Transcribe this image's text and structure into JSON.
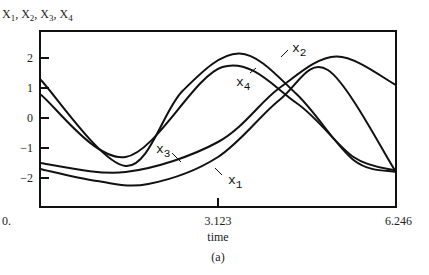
{
  "chart_data": {
    "type": "line",
    "title": "",
    "ylabel": "X1, X2, X3, X4",
    "xlabel": "time",
    "caption": "(a)",
    "xlim": [
      0,
      6.246
    ],
    "ylim": [
      -3,
      2.8
    ],
    "x_ticks": [
      {
        "value": 0,
        "label": "0."
      },
      {
        "value": 3.123,
        "label": "3.123"
      },
      {
        "value": 6.246,
        "label": "6.246"
      }
    ],
    "y_ticks": [
      {
        "value": 2,
        "label": "2"
      },
      {
        "value": 1,
        "label": "1"
      },
      {
        "value": 0,
        "label": "0"
      },
      {
        "value": -1,
        "label": "-1"
      },
      {
        "value": -2,
        "label": "-2"
      }
    ],
    "grid": false,
    "legend": "inline labels",
    "series": [
      {
        "name": "x1",
        "label": "x",
        "sub": "1",
        "offset": -0.3,
        "amp": 1.9,
        "peak_t": 5.05,
        "samples": [
          [
            0,
            -1.7
          ],
          [
            1.0,
            -2.1
          ],
          [
            1.9,
            -2.2
          ],
          [
            3.123,
            -1.3
          ],
          [
            4.2,
            0.6
          ],
          [
            5.05,
            1.6
          ],
          [
            6.246,
            -1.8
          ]
        ]
      },
      {
        "name": "x2",
        "label": "x",
        "sub": "2",
        "offset": 0.0,
        "amp": 2.15,
        "peak_t": 3.5,
        "samples": [
          [
            0,
            1.3
          ],
          [
            1.5,
            -1.6
          ],
          [
            2.5,
            0.9
          ],
          [
            3.5,
            2.15
          ],
          [
            4.5,
            0.8
          ],
          [
            5.5,
            -1.4
          ],
          [
            6.246,
            -1.8
          ]
        ]
      },
      {
        "name": "x3",
        "label": "x",
        "sub": "3",
        "offset": 0.15,
        "amp": 1.95,
        "peak_t": 5.2,
        "samples": [
          [
            0,
            -1.5
          ],
          [
            1.5,
            -1.8
          ],
          [
            3.123,
            -0.8
          ],
          [
            4.2,
            1.0
          ],
          [
            5.2,
            2.05
          ],
          [
            6.246,
            1.1
          ]
        ]
      },
      {
        "name": "x4",
        "label": "x",
        "sub": "4",
        "offset": -0.05,
        "amp": 1.75,
        "peak_t": 3.2,
        "samples": [
          [
            0,
            0.8
          ],
          [
            1.5,
            -1.3
          ],
          [
            3.2,
            1.7
          ],
          [
            4.5,
            0.5
          ],
          [
            5.5,
            -1.3
          ],
          [
            6.246,
            -1.75
          ]
        ]
      }
    ]
  },
  "labels": {
    "y_title_parts": [
      "X",
      "1",
      ", X",
      "2",
      ", X",
      "3",
      ", X",
      "4"
    ]
  }
}
